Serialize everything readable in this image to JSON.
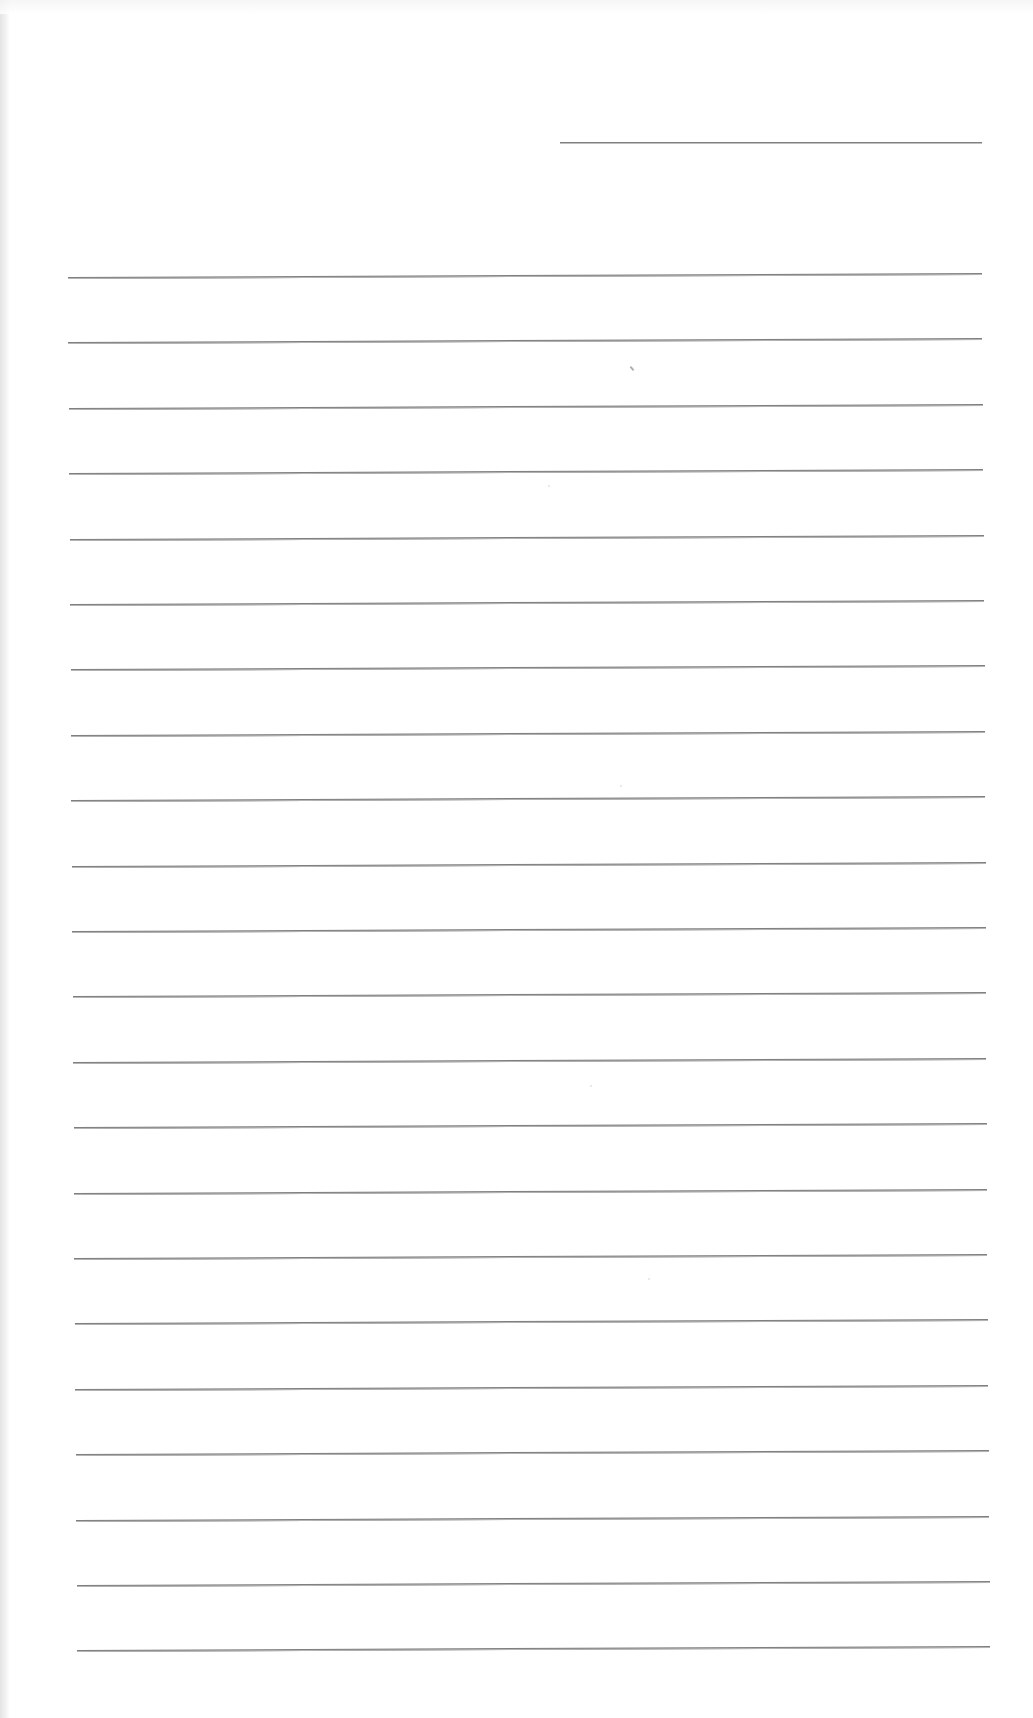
{
  "document": {
    "type": "lined-paper",
    "content_text": "",
    "header_line": {
      "x1": 560,
      "x2": 982,
      "y": 142
    },
    "ruled_lines": {
      "count": 22,
      "first_y": 277,
      "spacing": 65.4,
      "left_start": 68,
      "left_end": 77,
      "right_start": 982,
      "right_end": 990
    },
    "colors": {
      "paper": "#ffffff",
      "line": "#7f7f7f",
      "scan_edge": "#e4e4e4"
    }
  }
}
